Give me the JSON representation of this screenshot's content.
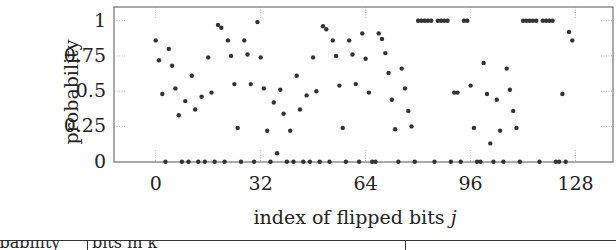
{
  "chart_data": {
    "type": "scatter",
    "title": "",
    "xlabel": "index of flipped bits j",
    "ylabel": "probability",
    "xlim": [
      -12,
      140
    ],
    "ylim": [
      0,
      1.05
    ],
    "xticks": [
      0,
      32,
      64,
      96,
      128
    ],
    "yticks": [
      0,
      0.25,
      0.5,
      0.75,
      1
    ],
    "ytick_labels": [
      "0",
      "0.25",
      "0.5",
      "0.75",
      "1"
    ],
    "grid": "dotted tick marks only",
    "legend": null,
    "marker_color": "#333333",
    "x": [
      0,
      1,
      2,
      3,
      4,
      5,
      6,
      7,
      8,
      9,
      10,
      11,
      12,
      13,
      14,
      15,
      16,
      17,
      18,
      19,
      20,
      21,
      22,
      23,
      24,
      25,
      26,
      27,
      28,
      29,
      30,
      31,
      32,
      33,
      34,
      35,
      36,
      37,
      38,
      39,
      40,
      41,
      42,
      43,
      44,
      45,
      46,
      47,
      48,
      49,
      50,
      51,
      52,
      53,
      54,
      55,
      56,
      57,
      58,
      59,
      60,
      61,
      62,
      63,
      64,
      65,
      66,
      67,
      68,
      69,
      70,
      71,
      72,
      73,
      74,
      75,
      76,
      77,
      78,
      79,
      80,
      81,
      82,
      83,
      84,
      85,
      86,
      87,
      88,
      89,
      90,
      91,
      92,
      93,
      94,
      95,
      96,
      97,
      98,
      99,
      100,
      101,
      102,
      103,
      104,
      105,
      106,
      107,
      108,
      109,
      110,
      111,
      112,
      113,
      114,
      115,
      116,
      117,
      118,
      119,
      120,
      121,
      122,
      123,
      124,
      125,
      126,
      127
    ],
    "y": [
      0.86,
      0.72,
      0.48,
      0,
      0.8,
      0.68,
      0.52,
      0.33,
      0,
      0.43,
      0,
      0.61,
      0.37,
      0,
      0.46,
      0,
      0.74,
      0.49,
      0,
      0.97,
      0.95,
      0,
      0.86,
      0.75,
      0.55,
      0.24,
      0,
      0.86,
      0.76,
      0.55,
      0,
      0.99,
      0.74,
      0.52,
      0.22,
      0,
      0.42,
      0.06,
      0.51,
      0.34,
      0,
      0.22,
      0,
      0.61,
      0.37,
      0,
      0.47,
      0,
      0.74,
      0.5,
      0,
      0.96,
      0.94,
      0,
      0.86,
      0.75,
      0.54,
      0.24,
      0,
      0.86,
      0.76,
      0.55,
      0,
      0.91,
      0.73,
      0.49,
      0,
      0,
      0.91,
      0.87,
      0.77,
      0.63,
      0.44,
      0.23,
      0,
      0.66,
      0.52,
      0.36,
      0.25,
      0,
      1,
      1,
      1,
      1,
      1,
      0,
      1,
      1,
      1,
      1,
      0,
      0.49,
      0.49,
      0,
      1,
      1,
      0.54,
      0.24,
      0,
      0,
      0.7,
      0.48,
      0.13,
      0,
      0.44,
      0.22,
      0,
      0.66,
      0.51,
      0.36,
      0.24,
      0,
      1,
      1,
      1,
      1,
      1,
      0,
      1,
      1,
      1,
      1,
      0,
      0,
      0.48,
      0,
      0.92,
      0.86
    ]
  },
  "table_fragment": {
    "col1": "probability",
    "col2": "bits in k"
  }
}
